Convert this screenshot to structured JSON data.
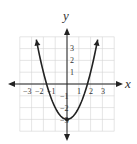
{
  "chart_data": {
    "type": "line",
    "title": "",
    "xlabel": "x",
    "ylabel": "y",
    "xlim": [
      -4,
      4
    ],
    "ylim": [
      -4,
      4
    ],
    "grid": true,
    "x_tick_labels": [
      "-3",
      "-2",
      "-1",
      "1",
      "2",
      "3"
    ],
    "y_tick_labels": [
      "3",
      "2",
      "1",
      "-1",
      "-2",
      "-3"
    ],
    "series": [
      {
        "name": "parabola",
        "equation": "y = x^2 - 3",
        "x": [
          -2.6,
          -2,
          -1.5,
          -1,
          -0.5,
          0,
          0.5,
          1,
          1.5,
          2,
          2.6
        ],
        "y": [
          3.76,
          1,
          -0.75,
          -2,
          -2.75,
          -3,
          -2.75,
          -2,
          -0.75,
          1,
          3.76
        ],
        "vertex": [
          0,
          -3
        ],
        "x_intercepts": [
          -1.73,
          1.73
        ],
        "arrows_at_ends": true
      }
    ],
    "colors": {
      "curve": "#222222",
      "grid": "#d0d0d0",
      "axes": "#222222"
    }
  },
  "labels": {
    "x_axis": "x",
    "y_axis": "y",
    "x_ticks": [
      "−3",
      "−2",
      "−1",
      "1",
      "2",
      "3"
    ],
    "y_ticks": [
      "3",
      "2",
      "1",
      "−1",
      "−2",
      "−3"
    ]
  }
}
